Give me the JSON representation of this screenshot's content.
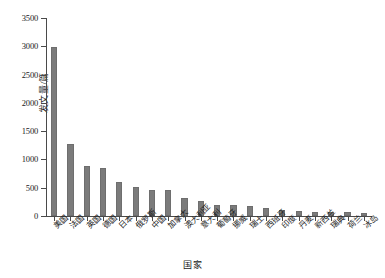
{
  "chart_data": {
    "type": "bar",
    "title": "",
    "xlabel": "国家",
    "ylabel": "发文量/篇",
    "ylim": [
      0,
      3500
    ],
    "ytick_step": 500,
    "ytick_labels": [
      "0",
      "500",
      "1000",
      "1500",
      "2000",
      "2500",
      "3000",
      "3500"
    ],
    "grid": false,
    "legend": "none",
    "bar_color": "#7b7b7b",
    "axis_color": "#4a4a4a",
    "categories": [
      "美国",
      "法国",
      "英国",
      "德国",
      "日本",
      "俄罗斯",
      "中国",
      "加拿大",
      "澳大利亚",
      "意大利",
      "葡萄牙",
      "挪威",
      "瑞士",
      "西班牙",
      "印度",
      "丹麦",
      "新西兰",
      "瑞典",
      "荷兰",
      "冰岛"
    ],
    "values": [
      2990,
      1265,
      890,
      845,
      595,
      520,
      465,
      455,
      320,
      260,
      195,
      190,
      180,
      150,
      100,
      80,
      75,
      70,
      65,
      60
    ]
  }
}
